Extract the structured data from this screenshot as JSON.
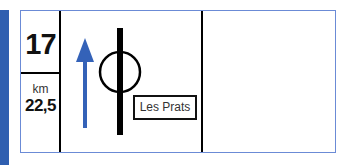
{
  "roadbook": {
    "step_number": "17",
    "distance_unit": "km",
    "distance_value": "22,5",
    "place_name": "Les Prats",
    "icons": {
      "direction": "straight-arrow-icon",
      "junction": "roundabout-circle-icon"
    },
    "colors": {
      "side_bar": "#2f5fb0",
      "arrow": "#3462b8",
      "frame_border": "#6b8bd6",
      "lines": "#000000"
    }
  }
}
